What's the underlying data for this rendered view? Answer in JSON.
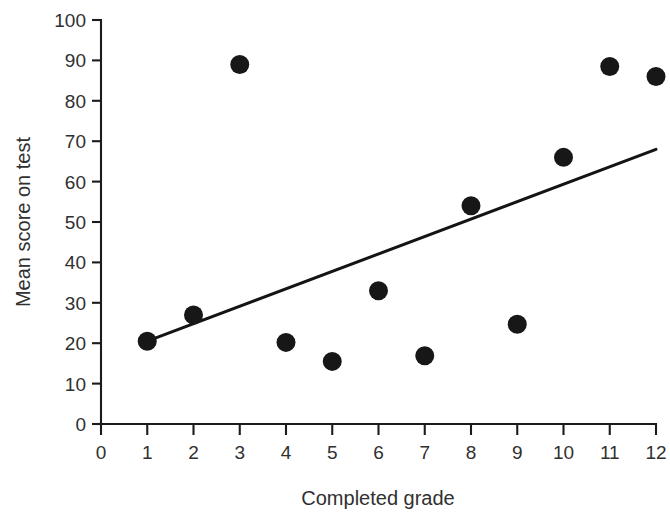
{
  "chart_data": {
    "type": "scatter",
    "title": "",
    "xlabel": "Completed grade",
    "ylabel": "Mean score on test",
    "xlim": [
      0,
      12
    ],
    "ylim": [
      0,
      100
    ],
    "xticks": [
      0,
      1,
      2,
      3,
      4,
      5,
      6,
      7,
      8,
      9,
      10,
      11,
      12
    ],
    "yticks": [
      0,
      10,
      20,
      30,
      40,
      50,
      60,
      70,
      80,
      90,
      100
    ],
    "xtick_labels": [
      "0",
      "1",
      "2",
      "3",
      "4",
      "5",
      "6",
      "7",
      "8",
      "9",
      "10",
      "11",
      "12"
    ],
    "ytick_labels": [
      "0",
      "10",
      "20",
      "30",
      "40",
      "50",
      "60",
      "70",
      "80",
      "90",
      "100"
    ],
    "grid": false,
    "legend": null,
    "marker": "filled-circle",
    "marker_color": "#171717",
    "x": [
      1,
      2,
      3,
      4,
      5,
      6,
      7,
      8,
      9,
      10,
      11,
      12
    ],
    "y": [
      20.5,
      27,
      89,
      20.2,
      15.5,
      33,
      16.9,
      54,
      24.7,
      66,
      88.5,
      86
    ],
    "points": [
      {
        "x": 1,
        "y": 20.5
      },
      {
        "x": 2,
        "y": 27
      },
      {
        "x": 3,
        "y": 89
      },
      {
        "x": 4,
        "y": 20.2
      },
      {
        "x": 5,
        "y": 15.5
      },
      {
        "x": 6,
        "y": 33
      },
      {
        "x": 7,
        "y": 16.9
      },
      {
        "x": 8,
        "y": 54
      },
      {
        "x": 9,
        "y": 24.7
      },
      {
        "x": 10,
        "y": 66
      },
      {
        "x": 11,
        "y": 88.5
      },
      {
        "x": 12,
        "y": 86
      }
    ],
    "trendline": {
      "type": "linear-fit",
      "x_start": 1,
      "y_start": 20.5,
      "x_end": 12,
      "y_end": 68,
      "color": "#141414"
    }
  }
}
